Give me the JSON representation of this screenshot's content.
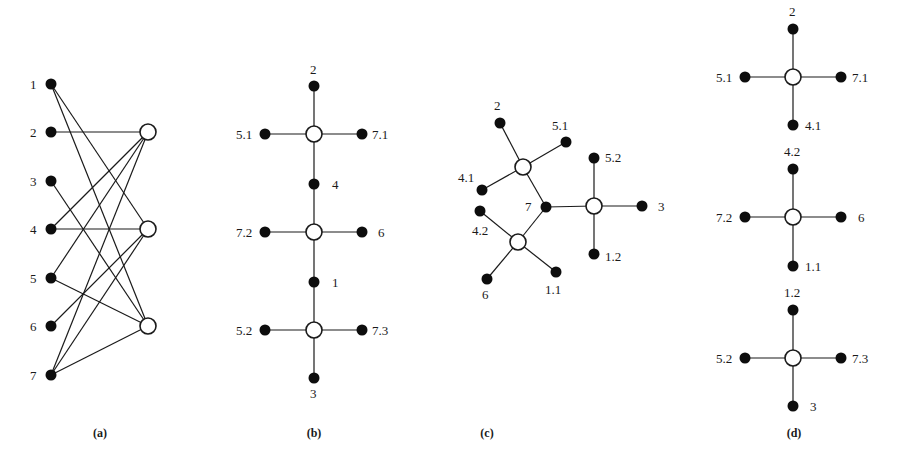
{
  "figure": {
    "panels": [
      {
        "id": "a",
        "caption": "(a)",
        "caption_pos": [
          100,
          437
        ],
        "description": "Bipartite graph: 7 filled vertices on left, 3 hollow vertices on right",
        "nodes": [
          {
            "id": "1",
            "label": "1",
            "type": "filled",
            "x": 51,
            "y": 84,
            "lx": 30,
            "ly": 89
          },
          {
            "id": "2",
            "label": "2",
            "type": "filled",
            "x": 51,
            "y": 132,
            "lx": 30,
            "ly": 137
          },
          {
            "id": "3",
            "label": "3",
            "type": "filled",
            "x": 51,
            "y": 181,
            "lx": 30,
            "ly": 186
          },
          {
            "id": "4",
            "label": "4",
            "type": "filled",
            "x": 51,
            "y": 229,
            "lx": 30,
            "ly": 234
          },
          {
            "id": "5",
            "label": "5",
            "type": "filled",
            "x": 51,
            "y": 278,
            "lx": 30,
            "ly": 283
          },
          {
            "id": "6",
            "label": "6",
            "type": "filled",
            "x": 51,
            "y": 326,
            "lx": 30,
            "ly": 331
          },
          {
            "id": "7",
            "label": "7",
            "type": "filled",
            "x": 51,
            "y": 375,
            "lx": 30,
            "ly": 380
          },
          {
            "id": "A",
            "label": "",
            "type": "hollow",
            "x": 148,
            "y": 132
          },
          {
            "id": "B",
            "label": "",
            "type": "hollow",
            "x": 148,
            "y": 229
          },
          {
            "id": "C",
            "label": "",
            "type": "hollow",
            "x": 148,
            "y": 326
          }
        ],
        "edges": [
          [
            "1",
            "B"
          ],
          [
            "1",
            "C"
          ],
          [
            "2",
            "A"
          ],
          [
            "3",
            "C"
          ],
          [
            "4",
            "A"
          ],
          [
            "4",
            "B"
          ],
          [
            "5",
            "A"
          ],
          [
            "5",
            "C"
          ],
          [
            "6",
            "B"
          ],
          [
            "7",
            "A"
          ],
          [
            "7",
            "B"
          ],
          [
            "7",
            "C"
          ]
        ]
      },
      {
        "id": "b",
        "caption": "(b)",
        "caption_pos": [
          314,
          437
        ],
        "description": "Chain of three hollow hubs with filled leaves",
        "nodes": [
          {
            "id": "H1",
            "label": "",
            "type": "hollow",
            "x": 314,
            "y": 134
          },
          {
            "id": "H2",
            "label": "",
            "type": "hollow",
            "x": 314,
            "y": 232
          },
          {
            "id": "H3",
            "label": "",
            "type": "hollow",
            "x": 314,
            "y": 330
          },
          {
            "id": "2",
            "label": "2",
            "type": "filled",
            "x": 314,
            "y": 86,
            "lx": 310,
            "ly": 74
          },
          {
            "id": "5.1",
            "label": "5.1",
            "type": "filled",
            "x": 265,
            "y": 134,
            "lx": 236,
            "ly": 139
          },
          {
            "id": "7.1",
            "label": "7.1",
            "type": "filled",
            "x": 362,
            "y": 134,
            "lx": 372,
            "ly": 139
          },
          {
            "id": "4",
            "label": "4",
            "type": "filled",
            "x": 314,
            "y": 184,
            "lx": 332,
            "ly": 189
          },
          {
            "id": "7.2",
            "label": "7.2",
            "type": "filled",
            "x": 265,
            "y": 232,
            "lx": 236,
            "ly": 237
          },
          {
            "id": "6",
            "label": "6",
            "type": "filled",
            "x": 362,
            "y": 232,
            "lx": 378,
            "ly": 237
          },
          {
            "id": "1",
            "label": "1",
            "type": "filled",
            "x": 314,
            "y": 282,
            "lx": 332,
            "ly": 287
          },
          {
            "id": "5.2",
            "label": "5.2",
            "type": "filled",
            "x": 265,
            "y": 330,
            "lx": 236,
            "ly": 335
          },
          {
            "id": "7.3",
            "label": "7.3",
            "type": "filled",
            "x": 362,
            "y": 330,
            "lx": 372,
            "ly": 335
          },
          {
            "id": "3",
            "label": "3",
            "type": "filled",
            "x": 314,
            "y": 378,
            "lx": 310,
            "ly": 398
          }
        ],
        "edges": [
          [
            "H1",
            "2"
          ],
          [
            "H1",
            "5.1"
          ],
          [
            "H1",
            "7.1"
          ],
          [
            "H1",
            "4"
          ],
          [
            "4",
            "H2"
          ],
          [
            "H2",
            "7.2"
          ],
          [
            "H2",
            "6"
          ],
          [
            "H2",
            "1"
          ],
          [
            "1",
            "H3"
          ],
          [
            "H3",
            "5.2"
          ],
          [
            "H3",
            "7.3"
          ],
          [
            "H3",
            "3"
          ]
        ]
      },
      {
        "id": "c",
        "caption": "(c)",
        "caption_pos": [
          487,
          437
        ],
        "description": "Tree with three hollow hubs joined at vertex 7",
        "nodes": [
          {
            "id": "H1",
            "label": "",
            "type": "hollow",
            "x": 523,
            "y": 167
          },
          {
            "id": "H2",
            "label": "",
            "type": "hollow",
            "x": 518,
            "y": 242
          },
          {
            "id": "H3",
            "label": "",
            "type": "hollow",
            "x": 594,
            "y": 206
          },
          {
            "id": "7",
            "label": "7",
            "type": "filled",
            "x": 546,
            "y": 207,
            "lx": 525,
            "ly": 211
          },
          {
            "id": "2",
            "label": "2",
            "type": "filled",
            "x": 500,
            "y": 123,
            "lx": 494,
            "ly": 110
          },
          {
            "id": "5.1",
            "label": "5.1",
            "type": "filled",
            "x": 566,
            "y": 142,
            "lx": 552,
            "ly": 130
          },
          {
            "id": "4.1",
            "label": "4.1",
            "type": "filled",
            "x": 482,
            "y": 190,
            "lx": 458,
            "ly": 182
          },
          {
            "id": "4.2",
            "label": "4.2",
            "type": "filled",
            "x": 480,
            "y": 211,
            "lx": 472,
            "ly": 235
          },
          {
            "id": "6",
            "label": "6",
            "type": "filled",
            "x": 487,
            "y": 279,
            "lx": 482,
            "ly": 299
          },
          {
            "id": "1.1",
            "label": "1.1",
            "type": "filled",
            "x": 556,
            "y": 272,
            "lx": 545,
            "ly": 294
          },
          {
            "id": "5.2",
            "label": "5.2",
            "type": "filled",
            "x": 594,
            "y": 158,
            "lx": 605,
            "ly": 162
          },
          {
            "id": "3",
            "label": "3",
            "type": "filled",
            "x": 642,
            "y": 206,
            "lx": 658,
            "ly": 211
          },
          {
            "id": "1.2",
            "label": "1.2",
            "type": "filled",
            "x": 594,
            "y": 254,
            "lx": 605,
            "ly": 261
          }
        ],
        "edges": [
          [
            "H1",
            "2"
          ],
          [
            "H1",
            "5.1"
          ],
          [
            "H1",
            "4.1"
          ],
          [
            "H1",
            "7"
          ],
          [
            "H2",
            "7"
          ],
          [
            "H2",
            "4.2"
          ],
          [
            "H2",
            "6"
          ],
          [
            "H2",
            "1.1"
          ],
          [
            "7",
            "H3"
          ],
          [
            "H3",
            "5.2"
          ],
          [
            "H3",
            "3"
          ],
          [
            "H3",
            "1.2"
          ]
        ]
      },
      {
        "id": "d",
        "caption": "(d)",
        "caption_pos": [
          794,
          437
        ],
        "description": "Three separate stars each with a hollow hub and four filled leaves",
        "nodes": [
          {
            "id": "H1",
            "label": "",
            "type": "hollow",
            "x": 793,
            "y": 77
          },
          {
            "id": "2",
            "label": "2",
            "type": "filled",
            "x": 793,
            "y": 29,
            "lx": 789,
            "ly": 16
          },
          {
            "id": "5.1",
            "label": "5.1",
            "type": "filled",
            "x": 745,
            "y": 77,
            "lx": 716,
            "ly": 82
          },
          {
            "id": "7.1",
            "label": "7.1",
            "type": "filled",
            "x": 841,
            "y": 77,
            "lx": 852,
            "ly": 82
          },
          {
            "id": "4.1",
            "label": "4.1",
            "type": "filled",
            "x": 793,
            "y": 125,
            "lx": 805,
            "ly": 130
          },
          {
            "id": "H2",
            "label": "",
            "type": "hollow",
            "x": 793,
            "y": 217
          },
          {
            "id": "4.2",
            "label": "4.2",
            "type": "filled",
            "x": 793,
            "y": 169,
            "lx": 784,
            "ly": 156
          },
          {
            "id": "7.2",
            "label": "7.2",
            "type": "filled",
            "x": 745,
            "y": 217,
            "lx": 716,
            "ly": 222
          },
          {
            "id": "6",
            "label": "6",
            "type": "filled",
            "x": 841,
            "y": 217,
            "lx": 858,
            "ly": 222
          },
          {
            "id": "1.1",
            "label": "1.1",
            "type": "filled",
            "x": 793,
            "y": 266,
            "lx": 805,
            "ly": 271
          },
          {
            "id": "H3",
            "label": "",
            "type": "hollow",
            "x": 793,
            "y": 358
          },
          {
            "id": "1.2",
            "label": "1.2",
            "type": "filled",
            "x": 793,
            "y": 310,
            "lx": 784,
            "ly": 297
          },
          {
            "id": "5.2",
            "label": "5.2",
            "type": "filled",
            "x": 745,
            "y": 358,
            "lx": 716,
            "ly": 363
          },
          {
            "id": "7.3",
            "label": "7.3",
            "type": "filled",
            "x": 841,
            "y": 358,
            "lx": 852,
            "ly": 363
          },
          {
            "id": "3",
            "label": "3",
            "type": "filled",
            "x": 793,
            "y": 406,
            "lx": 810,
            "ly": 411
          }
        ],
        "edges": [
          [
            "H1",
            "2"
          ],
          [
            "H1",
            "5.1"
          ],
          [
            "H1",
            "7.1"
          ],
          [
            "H1",
            "4.1"
          ],
          [
            "H2",
            "4.2"
          ],
          [
            "H2",
            "7.2"
          ],
          [
            "H2",
            "6"
          ],
          [
            "H2",
            "1.1"
          ],
          [
            "H3",
            "1.2"
          ],
          [
            "H3",
            "5.2"
          ],
          [
            "H3",
            "7.3"
          ],
          [
            "H3",
            "3"
          ]
        ]
      }
    ],
    "style": {
      "line_color": "#1a1a1a",
      "filled_node_color": "#0d0d0d",
      "hollow_node_fill": "#ffffff",
      "filled_radius": 5.5,
      "hollow_radius": 8
    }
  }
}
